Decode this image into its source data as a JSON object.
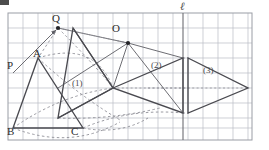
{
  "figure": {
    "canvas": {
      "width": 269,
      "height": 150,
      "background": "#ffffff"
    },
    "corner_mark": {
      "name": "corner-mark",
      "color": "#4d4d4d"
    },
    "grid": {
      "x0": 8,
      "y0": 13,
      "x1": 252,
      "y1": 140,
      "cell": 15,
      "line_color": "#b9bcc4",
      "border_color": "#9a9da5",
      "cols": 16,
      "rows": 8.5
    },
    "colors": {
      "solid_stroke": "#4a4a50",
      "dashed_stroke": "#8d8d95",
      "ray_stroke": "#5c5c63",
      "point_fill": "#232327",
      "label_text": "#2b2b2b",
      "small_label_text": "#4a4a4a",
      "grid_line": "#b9bcc4"
    },
    "points": [
      {
        "name": "P",
        "label": "P",
        "x": 13,
        "y": 73,
        "show_dot": false
      },
      {
        "name": "A",
        "label": "A",
        "x": 38,
        "y": 58,
        "show_dot": false
      },
      {
        "name": "B",
        "label": "B",
        "x": 13,
        "y": 128,
        "show_dot": false
      },
      {
        "name": "C",
        "label": "C",
        "x": 83,
        "y": 128,
        "show_dot": false
      },
      {
        "name": "Q",
        "label": "Q",
        "x": 58,
        "y": 28,
        "show_dot": true
      },
      {
        "name": "O",
        "label": "O",
        "x": 128,
        "y": 43,
        "show_dot": true
      }
    ],
    "point_labels": [
      {
        "name": "label-P",
        "text": "P",
        "left": 7,
        "top": 60
      },
      {
        "name": "label-A",
        "text": "A",
        "left": 33,
        "top": 48
      },
      {
        "name": "label-Q",
        "text": "Q",
        "left": 52,
        "top": 13
      },
      {
        "name": "label-O",
        "text": "O",
        "left": 112,
        "top": 23
      },
      {
        "name": "label-B",
        "text": "B",
        "left": 7,
        "top": 126
      },
      {
        "name": "label-C",
        "text": "C",
        "left": 71,
        "top": 126
      },
      {
        "name": "label-ell",
        "text": "ℓ",
        "left": 180,
        "top": 3
      }
    ],
    "figure_labels": [
      {
        "name": "figure-label-1",
        "text": "(1)",
        "left": 71,
        "top": 79
      },
      {
        "name": "figure-label-2",
        "text": "(2)",
        "left": 151,
        "top": 61
      },
      {
        "name": "figure-label-3",
        "text": "(3)",
        "left": 203,
        "top": 66
      }
    ],
    "triangles": [
      {
        "name": "triangle-1-original",
        "id": "(1)",
        "style": "solid",
        "vertices": [
          [
            38,
            58
          ],
          [
            13,
            128
          ],
          [
            83,
            128
          ]
        ]
      },
      {
        "name": "triangle-2-rotated",
        "id": "(2)",
        "style": "solid",
        "vertices": [
          [
            113,
            88
          ],
          [
            183,
            58
          ],
          [
            183,
            113
          ]
        ]
      },
      {
        "name": "triangle-3-translated",
        "id": "(3)",
        "style": "solid",
        "vertices": [
          [
            188,
            58
          ],
          [
            188,
            113
          ],
          [
            248,
            88
          ]
        ]
      },
      {
        "name": "triangle-intermediate",
        "id": "",
        "style": "solid",
        "vertices": [
          [
            73,
            28
          ],
          [
            58,
            118
          ],
          [
            113,
            88
          ]
        ]
      }
    ],
    "line_ell": {
      "name": "line-ell",
      "x": 183,
      "y_top": 13,
      "y_bottom": 140
    },
    "rays": [
      {
        "name": "ray-P-to-Q",
        "from": [
          13,
          73
        ],
        "to": [
          58,
          28
        ],
        "arrow": true
      },
      {
        "name": "ray-Q-to-A-dashed",
        "from": [
          58,
          28
        ],
        "to": [
          38,
          58
        ],
        "arrow": false
      },
      {
        "name": "ray-O-to-vertex-a",
        "from": [
          128,
          43
        ],
        "to": [
          113,
          88
        ],
        "arrow": false
      },
      {
        "name": "ray-O-to-vertex-b",
        "from": [
          128,
          43
        ],
        "to": [
          183,
          58
        ],
        "arrow": false
      },
      {
        "name": "ray-O-to-vertex-c",
        "from": [
          128,
          43
        ],
        "to": [
          183,
          113
        ],
        "arrow": false
      },
      {
        "name": "ray-O-to-Q",
        "from": [
          128,
          43
        ],
        "to": [
          58,
          28
        ],
        "arrow": false
      },
      {
        "name": "ray-O-to-left",
        "from": [
          128,
          43
        ],
        "to": [
          58,
          88
        ],
        "arrow": false
      }
    ],
    "dashed_paths": [
      {
        "name": "dashed-arc-A-to-2",
        "type": "arc"
      },
      {
        "name": "dashed-arc-B-to-2",
        "type": "arc"
      },
      {
        "name": "dashed-arc-C-to-2",
        "type": "arc"
      },
      {
        "name": "dashed-translate-top",
        "type": "line",
        "from": [
          183,
          58
        ],
        "to": [
          188,
          58
        ]
      },
      {
        "name": "dashed-translate-bottom",
        "type": "line",
        "from": [
          183,
          113
        ],
        "to": [
          188,
          113
        ]
      },
      {
        "name": "dashed-translate-mid",
        "type": "line",
        "from": [
          113,
          88
        ],
        "to": [
          248,
          88
        ]
      }
    ]
  }
}
